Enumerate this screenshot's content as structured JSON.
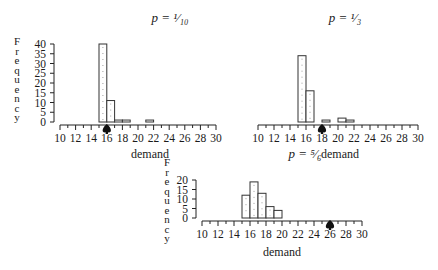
{
  "chart_data": [
    {
      "type": "bar",
      "title": "p = 1/10",
      "title_display": "p = ¹⁄₁₀",
      "xlabel": "demand",
      "ylabel": "Frequency",
      "xlim": [
        10,
        30
      ],
      "ylim": [
        0,
        40
      ],
      "x_ticks": [
        10,
        12,
        14,
        16,
        18,
        20,
        22,
        24,
        26,
        28,
        30
      ],
      "y_ticks": [
        0,
        5,
        10,
        15,
        20,
        25,
        30,
        35,
        40
      ],
      "show_y_axis": true,
      "categories": [
        15,
        16,
        17,
        18,
        21
      ],
      "values": [
        40,
        11,
        1,
        1,
        1
      ],
      "marker_x": 16,
      "grid": false
    },
    {
      "type": "bar",
      "title": "p = 1/3",
      "title_display": "p = ¹⁄₃",
      "xlabel": "demand",
      "ylabel": "",
      "xlim": [
        10,
        30
      ],
      "ylim": [
        0,
        40
      ],
      "x_ticks": [
        10,
        12,
        14,
        16,
        18,
        20,
        22,
        24,
        26,
        28,
        30
      ],
      "y_ticks": [],
      "show_y_axis": false,
      "categories": [
        15,
        16,
        18,
        20,
        21
      ],
      "values": [
        34,
        16,
        1,
        2,
        1
      ],
      "marker_x": 18,
      "grid": false
    },
    {
      "type": "bar",
      "title": "p = 5/6",
      "title_display": "p = ⁵⁄₆",
      "xlabel": "demand",
      "ylabel": "Frequency",
      "xlim": [
        10,
        30
      ],
      "ylim": [
        0,
        20
      ],
      "x_ticks": [
        10,
        12,
        14,
        16,
        18,
        20,
        22,
        24,
        26,
        28,
        30
      ],
      "y_ticks": [
        0,
        5,
        10,
        15,
        20
      ],
      "show_y_axis": true,
      "categories": [
        15,
        16,
        17,
        18,
        19
      ],
      "values": [
        12,
        19,
        13,
        6,
        4
      ],
      "marker_x": 26,
      "grid": false
    }
  ]
}
